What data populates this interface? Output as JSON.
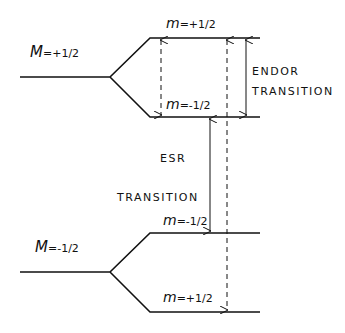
{
  "diagram": {
    "type": "energy-level diagram",
    "upper_manifold": {
      "label_M": "M",
      "label_M_value": "=+1/2",
      "levels": [
        {
          "label": "m",
          "value": "=+1/2"
        },
        {
          "label": "m",
          "value": "=-1/2"
        }
      ]
    },
    "lower_manifold": {
      "label_M": "M",
      "label_M_value": "=-1/2",
      "levels": [
        {
          "label": "m",
          "value": "=-1/2"
        },
        {
          "label": "m",
          "value": "=+1/2"
        }
      ]
    },
    "transitions": {
      "endor_line1": "ENDOR",
      "endor_line2": "TRANSITION",
      "esr_line1": "ESR",
      "esr_line2": "TRANSITION"
    },
    "colors": {
      "line": "#111111",
      "background": "#ffffff"
    }
  }
}
